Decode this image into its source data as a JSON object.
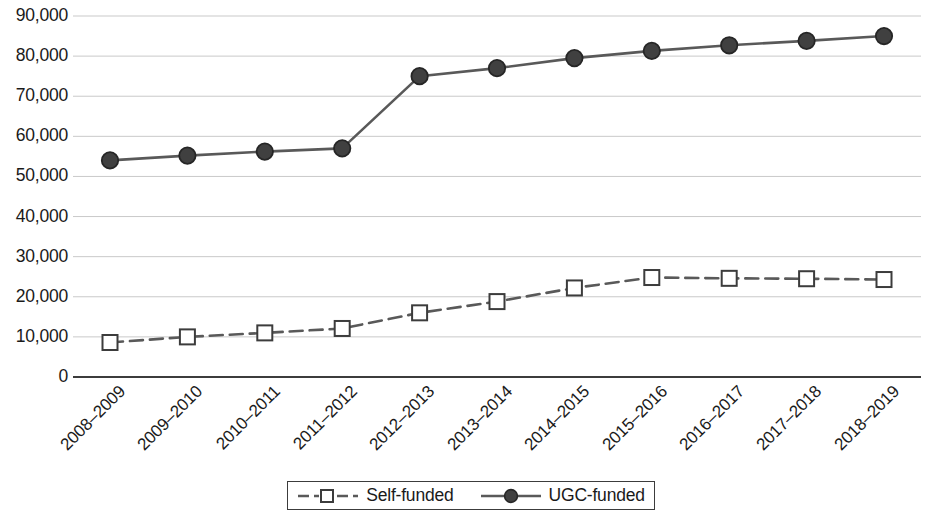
{
  "chart_data": {
    "type": "line",
    "title": "",
    "subtitle": "",
    "xlabel": "",
    "ylabel": "",
    "categories": [
      "2008–2009",
      "2009–2010",
      "2010–2011",
      "2011–2012",
      "2012–2013",
      "2013–2014",
      "2014–2015",
      "2015–2016",
      "2016–2017",
      "2017–2018",
      "2018–2019"
    ],
    "series": [
      {
        "name": "Self-funded",
        "values": [
          8600,
          10000,
          11000,
          12100,
          16000,
          18800,
          22200,
          24800,
          24600,
          24500,
          24300
        ],
        "marker": "open-square",
        "line_style": "dashed",
        "color": "#595959"
      },
      {
        "name": "UGC-funded",
        "values": [
          54000,
          55200,
          56200,
          57000,
          75000,
          77000,
          79500,
          81300,
          82700,
          83800,
          85000
        ],
        "marker": "filled-circle",
        "line_style": "solid",
        "color": "#595959"
      }
    ],
    "ylim": [
      0,
      90000
    ],
    "yticks": [
      0,
      10000,
      20000,
      30000,
      40000,
      50000,
      60000,
      70000,
      80000,
      90000
    ],
    "ytick_labels": [
      "0",
      "10,000",
      "20,000",
      "30,000",
      "40,000",
      "50,000",
      "60,000",
      "70,000",
      "80,000",
      "90,000"
    ],
    "grid": "horizontal",
    "legend_position": "bottom",
    "axis_line_color": "#3c3c3c",
    "grid_color": "#c9c9c9"
  },
  "legend": {
    "entries": [
      {
        "label": "Self-funded",
        "icon": "dashed-line-open-square-marker"
      },
      {
        "label": "UGC-funded",
        "icon": "solid-line-filled-circle-marker"
      }
    ]
  }
}
